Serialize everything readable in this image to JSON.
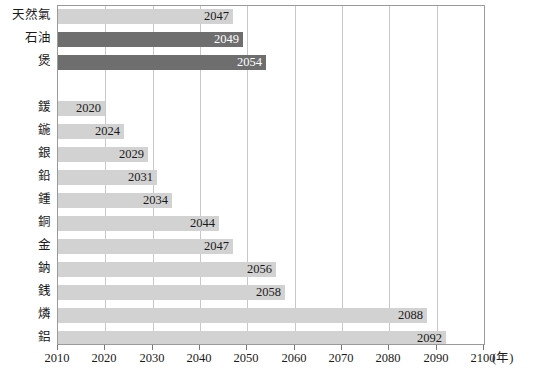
{
  "chart_data": {
    "type": "bar",
    "orientation": "horizontal",
    "title": "",
    "xlabel": "(年)",
    "ylabel": "",
    "xlim": [
      2010,
      2100
    ],
    "xticks": [
      2010,
      2020,
      2030,
      2040,
      2050,
      2060,
      2070,
      2080,
      2090,
      2100
    ],
    "xtick_labels": [
      "2010",
      "2020",
      "2030",
      "2040",
      "2050",
      "2060",
      "2070",
      "2080",
      "2090",
      "2100"
    ],
    "grid": true,
    "legend": false,
    "categories": [
      "天然氣",
      "石油",
      "煲",
      "",
      "鍰",
      "鍦",
      "銀",
      "鉛",
      "鍾",
      "銅",
      "金",
      "鈉",
      "銭",
      "燐",
      "鋁"
    ],
    "values": [
      2047,
      2049,
      2054,
      null,
      2020,
      2024,
      2029,
      2031,
      2034,
      2044,
      2047,
      2056,
      2058,
      2088,
      2092
    ],
    "bars": [
      {
        "label": "天然氣",
        "value": 2047,
        "value_text": "2047",
        "style": "light"
      },
      {
        "label": "石油",
        "value": 2049,
        "value_text": "2049",
        "style": "dark"
      },
      {
        "label": "煲",
        "value": 2054,
        "value_text": "2054",
        "style": "dark"
      },
      {
        "label": "",
        "value": null,
        "value_text": "",
        "style": "spacer"
      },
      {
        "label": "鍰",
        "value": 2020,
        "value_text": "2020",
        "style": "light"
      },
      {
        "label": "鍦",
        "value": 2024,
        "value_text": "2024",
        "style": "light"
      },
      {
        "label": "銀",
        "value": 2029,
        "value_text": "2029",
        "style": "light"
      },
      {
        "label": "鉛",
        "value": 2031,
        "value_text": "2031",
        "style": "light"
      },
      {
        "label": "鍾",
        "value": 2034,
        "value_text": "2034",
        "style": "light"
      },
      {
        "label": "銅",
        "value": 2044,
        "value_text": "2044",
        "style": "light"
      },
      {
        "label": "金",
        "value": 2047,
        "value_text": "2047",
        "style": "light"
      },
      {
        "label": "鈉",
        "value": 2056,
        "value_text": "2056",
        "style": "light"
      },
      {
        "label": "銭",
        "value": 2058,
        "value_text": "2058",
        "style": "light"
      },
      {
        "label": "燐",
        "value": 2088,
        "value_text": "2088",
        "style": "light"
      },
      {
        "label": "鋁",
        "value": 2092,
        "value_text": "2092",
        "style": "light"
      }
    ],
    "colors": {
      "light_bar": "#d2d2d2",
      "dark_bar": "#6e6e6e",
      "gridline": "#c8c8c8",
      "axis": "#9a9a9a",
      "background": "#ffffff",
      "text": "#1a1a1a"
    }
  },
  "caption": ""
}
